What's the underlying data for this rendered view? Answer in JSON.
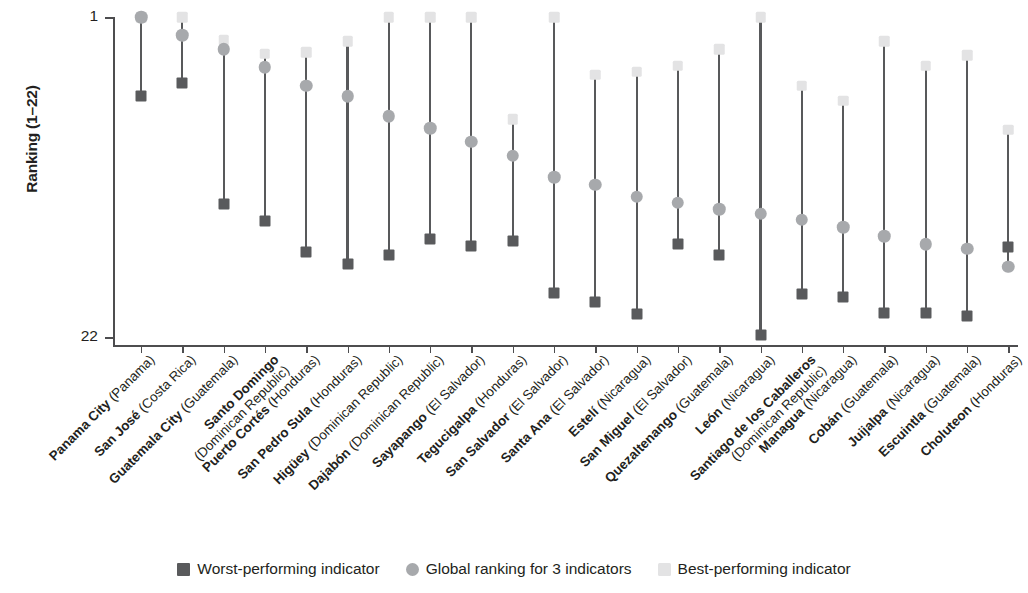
{
  "chart_data": {
    "type": "scatter",
    "title": "",
    "xlabel": "",
    "ylabel": "Ranking (1–22)",
    "ylim": [
      1,
      22
    ],
    "y_inverted": true,
    "yticks": [
      "1",
      "22"
    ],
    "grid": false,
    "legend_position": "bottom",
    "legend": [
      {
        "key": "worst",
        "label": "Worst-performing indicator",
        "marker": "square",
        "color": "#595a5c"
      },
      {
        "key": "global",
        "label": "Global ranking for 3 indicators",
        "marker": "circle",
        "color": "#a7a9ac"
      },
      {
        "key": "best",
        "label": "Best-performing indicator",
        "marker": "square",
        "color": "#e3e3e4"
      }
    ],
    "categories": [
      {
        "city": "Panama City",
        "country": "(Panama)"
      },
      {
        "city": "San José",
        "country": "(Costa Rica)"
      },
      {
        "city": "Guatemala City",
        "country": "(Guatemala)"
      },
      {
        "city": "Santo Domingo",
        "country": "(Dominican Republic)"
      },
      {
        "city": "Puerto Cortés",
        "country": "(Honduras)"
      },
      {
        "city": "San Pedro Sula",
        "country": "(Honduras)"
      },
      {
        "city": "Higüey",
        "country": "(Dominican Republic)"
      },
      {
        "city": "Dajabón",
        "country": "(Dominican Republic)"
      },
      {
        "city": "Sayapango",
        "country": "(El Salvador)"
      },
      {
        "city": "Tegucigalpa",
        "country": "(Honduras)"
      },
      {
        "city": "San Salvador",
        "country": "(El Salvador)"
      },
      {
        "city": "Santa Ana",
        "country": "(El Salvador)"
      },
      {
        "city": "Estelí",
        "country": "(Nicaragua)"
      },
      {
        "city": "San Miguel",
        "country": "(El Salvador)"
      },
      {
        "city": "Quezaltenango",
        "country": "(Guatemala)"
      },
      {
        "city": "León",
        "country": "(Nicaragua)"
      },
      {
        "city": "Santiago de los Caballeros",
        "country": "(Dominican Republic)"
      },
      {
        "city": "Managua",
        "country": "(Nicaragua)"
      },
      {
        "city": "Cobán",
        "country": "(Guatemala)"
      },
      {
        "city": "Juijalpa",
        "country": "(Nicaragua)"
      },
      {
        "city": "Escuintla",
        "country": "(Guatemala)"
      },
      {
        "city": "Choluteon",
        "country": "(Honduras)"
      }
    ],
    "series": [
      {
        "name": "Best-performing indicator",
        "values": [
          1,
          1,
          2.5,
          3.4,
          3.3,
          2.6,
          1,
          1,
          1,
          7.7,
          1,
          4.8,
          4.6,
          4.2,
          3.1,
          1,
          5.5,
          6.5,
          2.6,
          4.2,
          3.5,
          8.4
        ]
      },
      {
        "name": "Global ranking for 3 indicators",
        "values": [
          1,
          2.2,
          3.1,
          4.3,
          5.5,
          6.2,
          7.5,
          8.3,
          9.2,
          10.1,
          11.5,
          12.0,
          12.8,
          13.2,
          13.6,
          13.9,
          14.3,
          14.8,
          15.4,
          15.9,
          16.2,
          17.4
        ]
      },
      {
        "name": "Worst-performing indicator",
        "values": [
          6.2,
          5.3,
          13.3,
          14.4,
          16.4,
          17.2,
          16.6,
          15.6,
          16.0,
          15.7,
          19.1,
          19.7,
          20.5,
          15.9,
          16.6,
          21.9,
          19.2,
          19.4,
          20.4,
          20.4,
          20.6,
          16.1
        ]
      }
    ]
  }
}
